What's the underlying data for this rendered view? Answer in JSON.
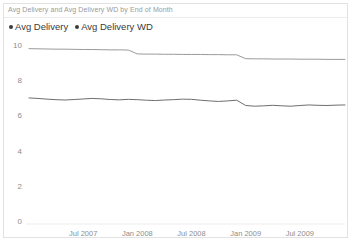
{
  "chart_title": "Avg Delivery and Avg Delivery WD by End of Month",
  "legend": {
    "entries": [
      {
        "label": "Avg Delivery",
        "marker": "dot-marker-icon",
        "color": "#3b3b3b"
      },
      {
        "label": "Avg Delivery WD",
        "marker": "dot-marker-icon",
        "color": "#3b3b3b"
      }
    ]
  },
  "axis": {
    "y_ticks": [
      "10",
      "8",
      "6",
      "4",
      "2",
      "0"
    ],
    "x_ticks": [
      "Jul 2007",
      "Jan 2008",
      "Jul 2008",
      "Jan 2009",
      "Jul 2009"
    ]
  },
  "chart_data": {
    "type": "line",
    "title": "Avg Delivery and Avg Delivery WD by End of Month",
    "xlabel": "End of Month",
    "ylabel": "",
    "ylim": [
      0,
      10
    ],
    "yticks": [
      0,
      2,
      4,
      6,
      8,
      10
    ],
    "grid": false,
    "legend_position": "top-left",
    "x": [
      "Jan 2007",
      "Feb 2007",
      "Mar 2007",
      "Apr 2007",
      "May 2007",
      "Jun 2007",
      "Jul 2007",
      "Aug 2007",
      "Sep 2007",
      "Oct 2007",
      "Nov 2007",
      "Dec 2007",
      "Jan 2008",
      "Feb 2008",
      "Mar 2008",
      "Apr 2008",
      "May 2008",
      "Jun 2008",
      "Jul 2008",
      "Aug 2008",
      "Sep 2008",
      "Oct 2008",
      "Nov 2008",
      "Dec 2008",
      "Jan 2009",
      "Feb 2009",
      "Mar 2009",
      "Apr 2009",
      "May 2009",
      "Jun 2009",
      "Jul 2009",
      "Aug 2009",
      "Sep 2009",
      "Oct 2009",
      "Nov 2009",
      "Dec 2009"
    ],
    "xtick_labels": [
      "Jul 2007",
      "Jan 2008",
      "Jul 2008",
      "Jan 2009",
      "Jul 2009"
    ],
    "xtick_indices": [
      6,
      12,
      18,
      24,
      30
    ],
    "series": [
      {
        "name": "Avg Delivery WD",
        "color": "#9a9a9a",
        "values": [
          9.85,
          9.84,
          9.83,
          9.82,
          9.82,
          9.81,
          9.8,
          9.8,
          9.79,
          9.78,
          9.78,
          9.77,
          9.55,
          9.54,
          9.54,
          9.53,
          9.53,
          9.52,
          9.52,
          9.52,
          9.51,
          9.51,
          9.5,
          9.5,
          9.28,
          9.27,
          9.27,
          9.26,
          9.26,
          9.26,
          9.25,
          9.25,
          9.25,
          9.24,
          9.24,
          9.24
        ]
      },
      {
        "name": "Avg Delivery",
        "color": "#6e6e6e",
        "values": [
          7.05,
          7.02,
          6.98,
          6.95,
          6.93,
          6.96,
          6.99,
          7.02,
          7.0,
          6.96,
          6.94,
          6.97,
          6.95,
          6.92,
          6.9,
          6.93,
          6.95,
          6.98,
          6.97,
          6.92,
          6.88,
          6.85,
          6.88,
          6.92,
          6.62,
          6.58,
          6.6,
          6.63,
          6.6,
          6.58,
          6.62,
          6.65,
          6.63,
          6.62,
          6.64,
          6.65
        ]
      }
    ]
  }
}
